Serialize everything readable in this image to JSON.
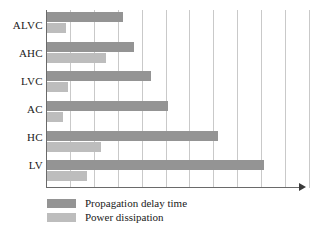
{
  "chart_data": {
    "type": "bar",
    "orientation": "horizontal",
    "title": "",
    "xlabel": "",
    "ylabel": "",
    "grid": true,
    "legend_position": "bottom-left",
    "categories": [
      "ALVC",
      "AHC",
      "LVC",
      "AC",
      "HC",
      "LV"
    ],
    "series": [
      {
        "name": "Propagation delay time",
        "color": "#949494",
        "values": [
          3.2,
          3.7,
          4.4,
          5.1,
          7.2,
          9.1
        ]
      },
      {
        "name": "Power dissipation",
        "color": "#bdbdbd",
        "values": [
          0.85,
          2.5,
          0.9,
          0.7,
          2.3,
          1.7
        ]
      }
    ],
    "xlim": [
      0,
      11
    ],
    "x_gridline_count": 11,
    "axis_color": "#6a6a6a",
    "grid_color": "#c9c9c9"
  },
  "legend": {
    "items": [
      {
        "label": "Propagation delay time",
        "swatch": "delay"
      },
      {
        "label": "Power dissipation",
        "swatch": "power"
      }
    ]
  },
  "axis": {
    "arrow_icon": "arrow-right-icon"
  }
}
